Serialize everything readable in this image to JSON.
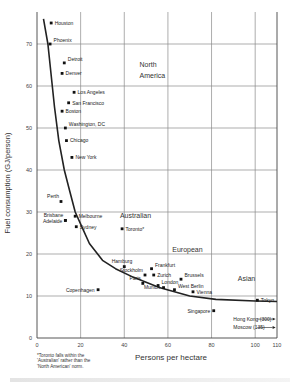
{
  "chart_data": {
    "type": "scatter",
    "title": "",
    "xlabel": "Persons per hectare",
    "ylabel": "Fuel consumption (GJ/person)",
    "xlim": [
      0,
      110
    ],
    "ylim": [
      0,
      76
    ],
    "xticks": [
      0,
      20,
      40,
      60,
      80,
      100,
      110
    ],
    "yticks": [
      0,
      10,
      20,
      30,
      40,
      50,
      60,
      70
    ],
    "grid": true,
    "points": [
      {
        "city": "Houston",
        "x": 6.5,
        "y": 75,
        "label_side": "right"
      },
      {
        "city": "Phoenix",
        "x": 6,
        "y": 70,
        "label_side": "right-up"
      },
      {
        "city": "Detroit",
        "x": 12.5,
        "y": 65.5,
        "label_side": "right-up"
      },
      {
        "city": "Denver",
        "x": 11.5,
        "y": 63,
        "label_side": "right"
      },
      {
        "city": "Los Angeles",
        "x": 17,
        "y": 58.5,
        "label_side": "right"
      },
      {
        "city": "San Francisco",
        "x": 14.5,
        "y": 56,
        "label_side": "right"
      },
      {
        "city": "Boston",
        "x": 11.5,
        "y": 54,
        "label_side": "right"
      },
      {
        "city": "Washington, DC",
        "x": 13,
        "y": 50,
        "label_side": "right-up"
      },
      {
        "city": "Chicago",
        "x": 13.5,
        "y": 47,
        "label_side": "right"
      },
      {
        "city": "New York",
        "x": 16,
        "y": 43,
        "label_side": "right"
      },
      {
        "city": "Perth",
        "x": 11,
        "y": 32.5,
        "label_side": "left-up"
      },
      {
        "city": "Brisbane",
        "x": 13,
        "y": 28,
        "label_side": "left-up"
      },
      {
        "city": "Adelaide",
        "x": 13,
        "y": 28,
        "label_side": "left"
      },
      {
        "city": "Melbourne",
        "x": 17.5,
        "y": 29,
        "label_side": "right"
      },
      {
        "city": "Sydney",
        "x": 18,
        "y": 26.5,
        "label_side": "right"
      },
      {
        "city": "Toronto*",
        "x": 39,
        "y": 26,
        "label_side": "right"
      },
      {
        "city": "Hamburg",
        "x": 40,
        "y": 17,
        "label_side": "left-up"
      },
      {
        "city": "Frankfurt",
        "x": 52.5,
        "y": 16.5,
        "label_side": "right-up"
      },
      {
        "city": "Stockholm",
        "x": 49.5,
        "y": 15,
        "label_side": "left-up"
      },
      {
        "city": "Zurich",
        "x": 53.5,
        "y": 15,
        "label_side": "right"
      },
      {
        "city": "Paris",
        "x": 48.5,
        "y": 13,
        "label_side": "left-up"
      },
      {
        "city": "London",
        "x": 55.5,
        "y": 12.5,
        "label_side": "right-up"
      },
      {
        "city": "Munich",
        "x": 58,
        "y": 12,
        "label_side": "left"
      },
      {
        "city": "Brussels",
        "x": 66,
        "y": 14,
        "label_side": "right-up"
      },
      {
        "city": "West Berlin",
        "x": 63,
        "y": 11.5,
        "label_side": "right-up"
      },
      {
        "city": "Vienna",
        "x": 71.5,
        "y": 11,
        "label_side": "right"
      },
      {
        "city": "Copenhagen",
        "x": 28,
        "y": 11.5,
        "label_side": "left"
      },
      {
        "city": "Tokyo",
        "x": 101,
        "y": 9,
        "label_side": "right"
      },
      {
        "city": "Singapore",
        "x": 81,
        "y": 6.5,
        "label_side": "left"
      }
    ],
    "offscale": [
      {
        "label": "Hong Kong (300)",
        "y": 4.5
      },
      {
        "label": "Moscow (135)",
        "y": 2.5
      }
    ],
    "region_labels": [
      {
        "text": "North",
        "x": 47,
        "y": 64.5
      },
      {
        "text": "America",
        "x": 47,
        "y": 62
      },
      {
        "text": "Australian",
        "x": 38,
        "y": 28.5
      },
      {
        "text": "European",
        "x": 62,
        "y": 20.5
      },
      {
        "text": "Asian",
        "x": 92,
        "y": 13.5
      }
    ],
    "trend_curve": [
      [
        3,
        76
      ],
      [
        5,
        70
      ],
      [
        8,
        55
      ],
      [
        10,
        47
      ],
      [
        12.5,
        40
      ],
      [
        15,
        35
      ],
      [
        17.5,
        30
      ],
      [
        21,
        26
      ],
      [
        24,
        22.5
      ],
      [
        30,
        18.5
      ],
      [
        36,
        16.5
      ],
      [
        44,
        14.5
      ],
      [
        56,
        12
      ],
      [
        70,
        10
      ],
      [
        82,
        9.2
      ],
      [
        100,
        8.8
      ],
      [
        110,
        8.7
      ]
    ],
    "footnote": [
      "*Toronto falls within the",
      "'Australian' rather than the",
      "'North American' norm."
    ]
  }
}
